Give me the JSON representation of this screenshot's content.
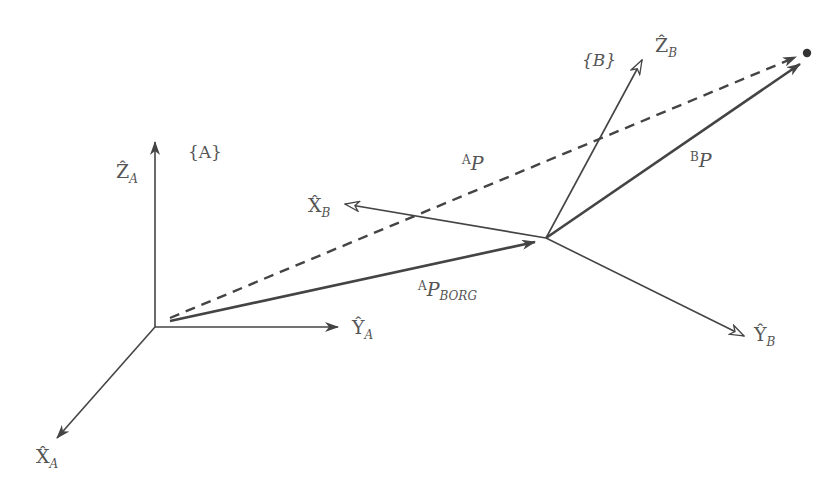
{
  "diagram": {
    "type": "coordinate-frame-transformation",
    "colors": {
      "stroke": "#444444",
      "text": "#555555",
      "background": "#ffffff"
    },
    "frames": {
      "A": {
        "label": "{A}",
        "origin": [
          155,
          327
        ]
      },
      "B": {
        "label": "{B}",
        "origin": [
          546,
          238
        ]
      }
    },
    "axes": {
      "ZA": {
        "symbol": "Ẑ",
        "sub": "A"
      },
      "YA": {
        "symbol": "Ŷ",
        "sub": "A"
      },
      "XA": {
        "symbol": "X̂",
        "sub": "A"
      },
      "ZB": {
        "symbol": "Ẑ",
        "sub": "B"
      },
      "YB": {
        "symbol": "Ŷ",
        "sub": "B"
      },
      "XB": {
        "symbol": "X̂",
        "sub": "B"
      }
    },
    "vectors": {
      "AP": {
        "sup": "A",
        "main": "P",
        "style": "dashed"
      },
      "BP": {
        "sup": "B",
        "main": "P",
        "style": "solid"
      },
      "APBORG": {
        "sup": "A",
        "main": "P",
        "sub": "BORG",
        "style": "solid"
      }
    },
    "point": {
      "position": [
        807,
        53
      ]
    }
  }
}
